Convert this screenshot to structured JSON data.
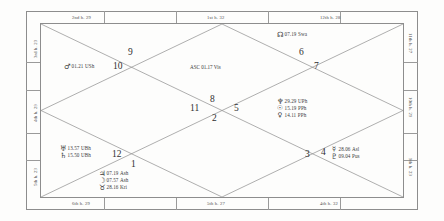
{
  "chart": {
    "type": "north-indian-vedic-kundli",
    "ascendant": {
      "label": "ASC",
      "degree": "01.17",
      "nakshatra": "Vis"
    },
    "house_numbers": [
      "1",
      "2",
      "3",
      "4",
      "5",
      "6",
      "7",
      "8",
      "9",
      "10",
      "11",
      "12"
    ],
    "border_labels": {
      "top": [
        {
          "name": "2nd h. 29"
        },
        {
          "name": "1st h. 32"
        },
        {
          "name": "12th h. 28"
        }
      ],
      "right": [
        {
          "name": "11th h. 27"
        },
        {
          "name": "10th h. 29"
        },
        {
          "name": "9th h. 23"
        }
      ],
      "bottom": [
        {
          "name": "6th h. 29"
        },
        {
          "name": "5th h. 27"
        },
        {
          "name": "4th h. 32"
        }
      ],
      "left": [
        {
          "name": "3rd h. 23"
        },
        {
          "name": "4th h. 29"
        },
        {
          "name": "5th h. 23"
        }
      ]
    },
    "planets": [
      {
        "id": "mars",
        "glyph": "♂",
        "name": "Mars",
        "degree": "01.21",
        "nakshatra": "USh",
        "house": "10"
      },
      {
        "id": "rahu",
        "glyph": "☊",
        "name": "Rahu",
        "degree": "07.19",
        "nakshatra": "Swa",
        "house": "7"
      },
      {
        "id": "neptune",
        "glyph": "♆",
        "name": "Neptune",
        "degree": "29.29",
        "nakshatra": "UPh",
        "house": "6"
      },
      {
        "id": "sun",
        "glyph": "☉",
        "name": "Sun",
        "degree": "15.19",
        "nakshatra": "PPh",
        "house": "6"
      },
      {
        "id": "venus",
        "glyph": "♀",
        "name": "Venus",
        "degree": "14.11",
        "nakshatra": "PPh",
        "house": "6"
      },
      {
        "id": "mercury",
        "glyph": "☿",
        "name": "Mercury",
        "degree": "28.06",
        "nakshatra": "Asl",
        "house": "4"
      },
      {
        "id": "pluto",
        "glyph": "♇",
        "name": "Pluto",
        "degree": "09.04",
        "nakshatra": "Pus",
        "house": "4"
      },
      {
        "id": "uranus",
        "glyph": "♅",
        "name": "Uranus",
        "degree": "13.57",
        "nakshatra": "UBh",
        "house": "12"
      },
      {
        "id": "saturn",
        "glyph": "♄",
        "name": "Saturn",
        "degree": "15.50",
        "nakshatra": "UBh",
        "house": "12"
      },
      {
        "id": "jupiter",
        "glyph": "♃",
        "name": "Jupiter",
        "degree": "07.19",
        "nakshatra": "Ash",
        "house": "1"
      },
      {
        "id": "moon",
        "glyph": "☽",
        "name": "Moon",
        "degree": "07.57",
        "nakshatra": "Ash",
        "house": "1"
      },
      {
        "id": "ketu",
        "glyph": "♉",
        "name": "Ketu",
        "degree": "28.16",
        "nakshatra": "Kri",
        "house": "1"
      }
    ],
    "colors": {
      "line": "#8d8d8d",
      "text": "#3a3a3a",
      "background": "#ffffff"
    }
  }
}
